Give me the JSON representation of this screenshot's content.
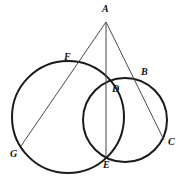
{
  "figure": {
    "canvas": {
      "width": 186,
      "height": 185,
      "background": "#ffffff"
    },
    "style": {
      "circle_stroke": "#1a1a1a",
      "circle_stroke_width": 2.0,
      "line_stroke": "#4a4a4a",
      "line_stroke_width": 1.0,
      "label_color": "#111111",
      "label_font_size": 10
    },
    "circles": [
      {
        "name": "large-circle",
        "cx": 68,
        "cy": 117,
        "r": 56
      },
      {
        "name": "small-circle",
        "cx": 125,
        "cy": 120,
        "r": 42
      }
    ],
    "segments": [
      {
        "name": "segment-a-g",
        "from": "A",
        "to": "G",
        "x1": 106,
        "y1": 22,
        "x2": 21,
        "y2": 146
      },
      {
        "name": "segment-a-e",
        "from": "A",
        "to": "E",
        "x1": 106,
        "y1": 22,
        "x2": 106,
        "y2": 157
      },
      {
        "name": "segment-a-c",
        "from": "A",
        "to": "C",
        "x1": 106,
        "y1": 22,
        "x2": 164,
        "y2": 140
      }
    ],
    "points": [
      {
        "id": "A",
        "label": "A",
        "x": 106,
        "y": 22,
        "label_x": 102,
        "label_y": 4
      },
      {
        "id": "F",
        "label": "F",
        "x": 72,
        "y": 67,
        "label_x": 64,
        "label_y": 52
      },
      {
        "id": "B",
        "label": "B",
        "x": 138,
        "y": 79,
        "label_x": 141,
        "label_y": 67
      },
      {
        "id": "D",
        "label": "D",
        "x": 107,
        "y": 86,
        "label_x": 112,
        "label_y": 84
      },
      {
        "id": "C",
        "label": "C",
        "x": 164,
        "y": 140,
        "label_x": 168,
        "label_y": 137
      },
      {
        "id": "G",
        "label": "G",
        "x": 21,
        "y": 146,
        "label_x": 10,
        "label_y": 149
      },
      {
        "id": "E",
        "label": "E",
        "x": 106,
        "y": 157,
        "label_x": 103,
        "label_y": 160
      }
    ]
  }
}
